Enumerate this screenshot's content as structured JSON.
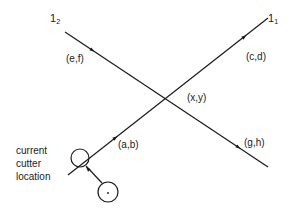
{
  "diagram": {
    "lines": [
      {
        "id": "l1",
        "name": "1",
        "subscript": "1",
        "from": [
          68,
          175
        ],
        "to": [
          268,
          18
        ]
      },
      {
        "id": "l2",
        "name": "1",
        "subscript": "2",
        "from": [
          65,
          32
        ],
        "to": [
          268,
          167
        ]
      }
    ],
    "points": {
      "ab": "(a,b)",
      "cd": "(c,d)",
      "ef": "(e,f)",
      "gh": "(g,h)",
      "xy": "(x,y)"
    },
    "cutter": {
      "caption_line1": "current",
      "caption_line2": "cutter",
      "caption_line3": "location",
      "current_circle": {
        "cx": 80,
        "cy": 158,
        "r": 9
      },
      "other_circle": {
        "cx": 108,
        "cy": 192,
        "r": 10
      }
    },
    "colors": {
      "stroke": "#1a1a1a",
      "background": "#ffffff"
    }
  }
}
